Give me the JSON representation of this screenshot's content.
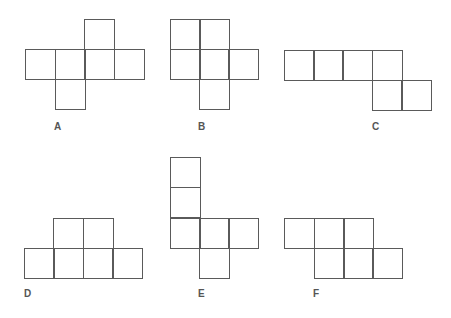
{
  "diagram": {
    "title": "",
    "line_color": "#5a5a5a",
    "label_color": "#555555",
    "square_size": 30,
    "nets": [
      {
        "label": "A",
        "label_pos": [
          54,
          122
        ],
        "squares": [
          [
            84,
            19
          ],
          [
            25,
            49
          ],
          [
            55,
            49
          ],
          [
            84,
            49
          ],
          [
            114,
            49
          ],
          [
            55,
            79
          ]
        ]
      },
      {
        "label": "B",
        "label_pos": [
          198,
          122
        ],
        "squares": [
          [
            170,
            19
          ],
          [
            199,
            19
          ],
          [
            170,
            49
          ],
          [
            199,
            49
          ],
          [
            228,
            49
          ],
          [
            199,
            79
          ]
        ]
      },
      {
        "label": "C",
        "label_pos": [
          372,
          122
        ],
        "squares": [
          [
            284,
            50
          ],
          [
            313,
            50
          ],
          [
            342,
            50
          ],
          [
            372,
            50
          ],
          [
            372,
            80
          ],
          [
            401,
            80
          ]
        ]
      },
      {
        "label": "D",
        "label_pos": [
          24,
          289
        ],
        "squares": [
          [
            53,
            218
          ],
          [
            83,
            218
          ],
          [
            24,
            248
          ],
          [
            53,
            248
          ],
          [
            83,
            248
          ],
          [
            112,
            248
          ]
        ]
      },
      {
        "label": "E",
        "label_pos": [
          198,
          289
        ],
        "squares": [
          [
            170,
            157
          ],
          [
            170,
            187
          ],
          [
            170,
            218
          ],
          [
            199,
            218
          ],
          [
            228,
            218
          ],
          [
            199,
            248
          ]
        ]
      },
      {
        "label": "F",
        "label_pos": [
          313,
          289
        ],
        "squares": [
          [
            284,
            218
          ],
          [
            314,
            218
          ],
          [
            343,
            218
          ],
          [
            314,
            248
          ],
          [
            343,
            248
          ],
          [
            372,
            248
          ]
        ]
      }
    ]
  }
}
